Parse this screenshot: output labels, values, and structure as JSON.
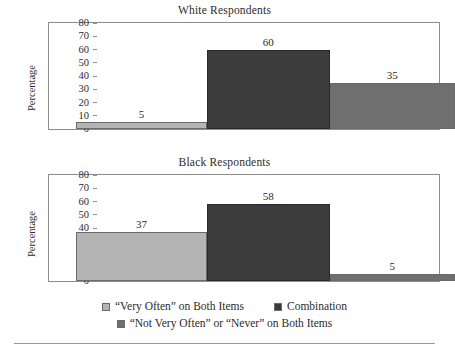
{
  "chart_data": [
    {
      "type": "bar",
      "title": "White Respondents",
      "xlabel": "",
      "ylabel": "Percentage",
      "ylim": [
        0,
        80
      ],
      "yticks": [
        0,
        10,
        20,
        30,
        40,
        50,
        60,
        70,
        80
      ],
      "grid": false,
      "legend_position": "bottom",
      "categories": [
        "“Very Often” on Both Items",
        "Combination",
        "“Not Very Often” or “Never” on Both Items"
      ],
      "values": [
        5,
        60,
        35
      ],
      "value_labels": [
        "5",
        "60",
        "35"
      ],
      "colors": [
        "#b4b4b4",
        "#3c3c3c",
        "#6f6f6f"
      ]
    },
    {
      "type": "bar",
      "title": "Black Respondents",
      "xlabel": "",
      "ylabel": "Percentage",
      "ylim": [
        0,
        80
      ],
      "yticks": [
        0,
        10,
        20,
        30,
        40,
        50,
        60,
        70,
        80
      ],
      "grid": false,
      "legend_position": "bottom",
      "categories": [
        "“Very Often” on Both Items",
        "Combination",
        "“Not Very Often” or “Never” on Both Items"
      ],
      "values": [
        37,
        58,
        5
      ],
      "value_labels": [
        "37",
        "58",
        "5"
      ],
      "colors": [
        "#b4b4b4",
        "#3c3c3c",
        "#6f6f6f"
      ]
    }
  ],
  "panels": {
    "white": {
      "title": "White Respondents",
      "ylabel": "Percentage",
      "yticks": [
        "80",
        "70",
        "60",
        "50",
        "40",
        "30",
        "20",
        "10",
        "0"
      ],
      "bars": [
        {
          "label": "5",
          "value": 5
        },
        {
          "label": "60",
          "value": 60
        },
        {
          "label": "35",
          "value": 35
        }
      ]
    },
    "black": {
      "title": "Black Respondents",
      "ylabel": "Percentage",
      "yticks": [
        "80",
        "70",
        "60",
        "50",
        "40",
        "30",
        "20",
        "10",
        "0"
      ],
      "bars": [
        {
          "label": "37",
          "value": 37
        },
        {
          "label": "58",
          "value": 58
        },
        {
          "label": "5",
          "value": 5
        }
      ]
    }
  },
  "legend": {
    "row1": [
      {
        "label": "“Very Often” on Both Items",
        "color": "#b4b4b4"
      },
      {
        "label": "Combination",
        "color": "#3c3c3c"
      }
    ],
    "row2": [
      {
        "label": "“Not Very Often” or “Never” on Both Items",
        "color": "#6f6f6f"
      }
    ]
  }
}
